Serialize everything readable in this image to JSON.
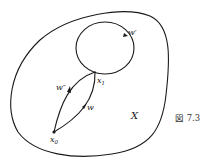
{
  "figure": {
    "caption": "図 7.3",
    "region_label": "X",
    "points": [
      {
        "name": "x0",
        "label_base": "x",
        "label_sub": "0"
      },
      {
        "name": "x1",
        "label_base": "x",
        "label_sub": "1"
      }
    ],
    "paths": [
      {
        "name": "w",
        "label": "w"
      },
      {
        "name": "w-prime",
        "label": "w′"
      },
      {
        "name": "w-double-prime",
        "label": "w″"
      }
    ],
    "colors": {
      "stroke": "#1a1a1a",
      "background": "#ffffff"
    }
  }
}
